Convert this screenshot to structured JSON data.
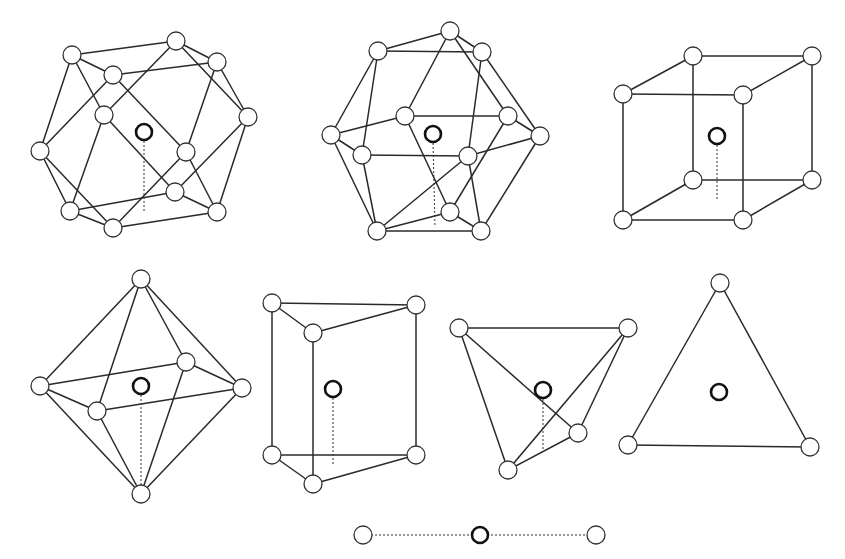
{
  "figure": {
    "colors": {
      "background": "#ffffff",
      "line": "#2a2a2a",
      "central_atom": "#111111"
    },
    "polyhedra": [
      {
        "name": "cuboctahedron",
        "coordination": 12,
        "center": [
          144,
          132
        ],
        "drop": [
          144,
          212
        ],
        "r": 9,
        "vertices": [
          [
            72,
            55
          ],
          [
            176,
            41
          ],
          [
            217,
            62
          ],
          [
            113,
            75
          ],
          [
            104,
            115
          ],
          [
            248,
            117
          ],
          [
            40,
            151
          ],
          [
            186,
            152
          ],
          [
            70,
            211
          ],
          [
            113,
            228
          ],
          [
            175,
            192
          ],
          [
            217,
            212
          ]
        ],
        "edges": [
          [
            0,
            1
          ],
          [
            0,
            3
          ],
          [
            0,
            6
          ],
          [
            0,
            4
          ],
          [
            1,
            2
          ],
          [
            1,
            5
          ],
          [
            3,
            2
          ],
          [
            3,
            6
          ],
          [
            3,
            7
          ],
          [
            2,
            5
          ],
          [
            2,
            7
          ],
          [
            4,
            1
          ],
          [
            4,
            8
          ],
          [
            4,
            10
          ],
          [
            6,
            8
          ],
          [
            6,
            9
          ],
          [
            5,
            10
          ],
          [
            5,
            11
          ],
          [
            7,
            9
          ],
          [
            7,
            11
          ],
          [
            8,
            9
          ],
          [
            9,
            11
          ],
          [
            8,
            10
          ],
          [
            10,
            11
          ]
        ]
      },
      {
        "name": "icosahedron",
        "coordination": 12,
        "center": [
          433,
          134
        ],
        "drop": [
          435,
          227
        ],
        "r": 9,
        "vertices": [
          [
            450,
            31
          ],
          [
            378,
            51
          ],
          [
            482,
            52
          ],
          [
            405,
            116
          ],
          [
            508,
            116
          ],
          [
            331,
            135
          ],
          [
            540,
            136
          ],
          [
            362,
            155
          ],
          [
            468,
            156
          ],
          [
            450,
            212
          ],
          [
            377,
            231
          ],
          [
            481,
            231
          ]
        ],
        "edges": [
          [
            0,
            1
          ],
          [
            0,
            2
          ],
          [
            0,
            3
          ],
          [
            0,
            4
          ],
          [
            1,
            2
          ],
          [
            1,
            5
          ],
          [
            1,
            7
          ],
          [
            2,
            6
          ],
          [
            2,
            8
          ],
          [
            3,
            4
          ],
          [
            3,
            5
          ],
          [
            3,
            9
          ],
          [
            4,
            6
          ],
          [
            4,
            9
          ],
          [
            5,
            7
          ],
          [
            5,
            10
          ],
          [
            6,
            8
          ],
          [
            6,
            11
          ],
          [
            7,
            8
          ],
          [
            7,
            10
          ],
          [
            8,
            11
          ],
          [
            8,
            10
          ],
          [
            9,
            10
          ],
          [
            9,
            11
          ],
          [
            10,
            11
          ]
        ]
      },
      {
        "name": "cube",
        "coordination": 8,
        "center": [
          717,
          136
        ],
        "drop": [
          717,
          200
        ],
        "r": 9,
        "vertices": [
          [
            693,
            56
          ],
          [
            812,
            56
          ],
          [
            623,
            94
          ],
          [
            743,
            95
          ],
          [
            693,
            180
          ],
          [
            812,
            180
          ],
          [
            623,
            220
          ],
          [
            743,
            220
          ]
        ],
        "edges": [
          [
            0,
            1
          ],
          [
            0,
            2
          ],
          [
            1,
            3
          ],
          [
            2,
            3
          ],
          [
            0,
            4
          ],
          [
            1,
            5
          ],
          [
            2,
            6
          ],
          [
            3,
            7
          ],
          [
            4,
            5
          ],
          [
            4,
            6
          ],
          [
            5,
            7
          ],
          [
            6,
            7
          ]
        ]
      },
      {
        "name": "octahedron",
        "coordination": 6,
        "center": [
          141,
          386
        ],
        "drop": [
          141,
          490
        ],
        "r": 9,
        "vertices": [
          [
            141,
            279
          ],
          [
            40,
            386
          ],
          [
            186,
            362
          ],
          [
            242,
            388
          ],
          [
            97,
            411
          ],
          [
            141,
            494
          ]
        ],
        "edges": [
          [
            0,
            1
          ],
          [
            0,
            2
          ],
          [
            0,
            3
          ],
          [
            0,
            4
          ],
          [
            1,
            2
          ],
          [
            2,
            3
          ],
          [
            3,
            4
          ],
          [
            4,
            1
          ],
          [
            5,
            1
          ],
          [
            5,
            2
          ],
          [
            5,
            3
          ],
          [
            5,
            4
          ]
        ]
      },
      {
        "name": "trigonal-prism",
        "coordination": 6,
        "center": [
          333,
          389
        ],
        "drop": [
          333,
          465
        ],
        "r": 9,
        "vertices": [
          [
            272,
            303
          ],
          [
            416,
            305
          ],
          [
            313,
            333
          ],
          [
            272,
            455
          ],
          [
            416,
            455
          ],
          [
            313,
            484
          ]
        ],
        "edges": [
          [
            0,
            1
          ],
          [
            0,
            2
          ],
          [
            1,
            2
          ],
          [
            0,
            3
          ],
          [
            1,
            4
          ],
          [
            2,
            5
          ],
          [
            3,
            4
          ],
          [
            3,
            5
          ],
          [
            4,
            5
          ]
        ]
      },
      {
        "name": "tetrahedron",
        "coordination": 4,
        "center": [
          543,
          390
        ],
        "drop": [
          543,
          452
        ],
        "r": 9,
        "vertices": [
          [
            459,
            328
          ],
          [
            628,
            328
          ],
          [
            578,
            433
          ],
          [
            508,
            470
          ]
        ],
        "edges": [
          [
            0,
            1
          ],
          [
            0,
            3
          ],
          [
            0,
            2
          ],
          [
            1,
            2
          ],
          [
            1,
            3
          ],
          [
            2,
            3
          ]
        ]
      },
      {
        "name": "triangle",
        "coordination": 3,
        "center": [
          719,
          392
        ],
        "drop": null,
        "r": 9,
        "vertices": [
          [
            720,
            283
          ],
          [
            628,
            445
          ],
          [
            810,
            447
          ]
        ],
        "edges": [
          [
            0,
            1
          ],
          [
            0,
            2
          ],
          [
            1,
            2
          ]
        ]
      },
      {
        "name": "linear",
        "coordination": 2,
        "center": [
          480,
          535
        ],
        "drop": null,
        "r": 9,
        "vertices": [
          [
            363,
            535
          ],
          [
            596,
            535
          ]
        ],
        "edges": [],
        "dashed_edges": [
          [
            0,
            1
          ]
        ]
      }
    ]
  }
}
